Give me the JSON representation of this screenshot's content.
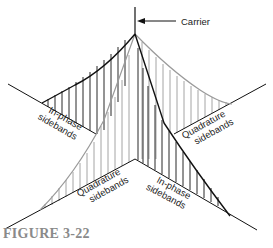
{
  "figure": {
    "caption": "FIGURE 3-22",
    "labels": {
      "carrier": "Carrier",
      "back_left": [
        "In-phase",
        "sidebands"
      ],
      "back_right": [
        "Quadrature",
        "sidebands"
      ],
      "front_left": [
        "Quadrature",
        "sidebands"
      ],
      "front_right": [
        "In-phase",
        "sidebands"
      ]
    },
    "colors": {
      "in_phase": "#111111",
      "quadrature": "#9a9a9a",
      "caption": "#8a8a8a"
    }
  }
}
